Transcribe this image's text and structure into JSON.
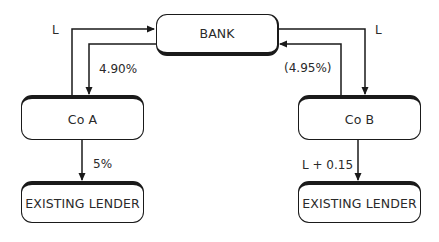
{
  "diagram": {
    "nodes": {
      "bank": "BANK",
      "co_a": "Co A",
      "co_b": "Co B",
      "lender_a": "EXISTING LENDER",
      "lender_b": "EXISTING LENDER"
    },
    "edges": {
      "co_a_to_bank": "L",
      "bank_to_co_a": "4.90%",
      "bank_to_co_b": "L",
      "co_b_to_bank": "(4.95%)",
      "co_a_to_lender": "5%",
      "co_b_to_lender": "L + 0.15"
    },
    "colors": {
      "line": "#1a1a1a",
      "text": "#2a2a2a",
      "background": "#ffffff"
    }
  }
}
